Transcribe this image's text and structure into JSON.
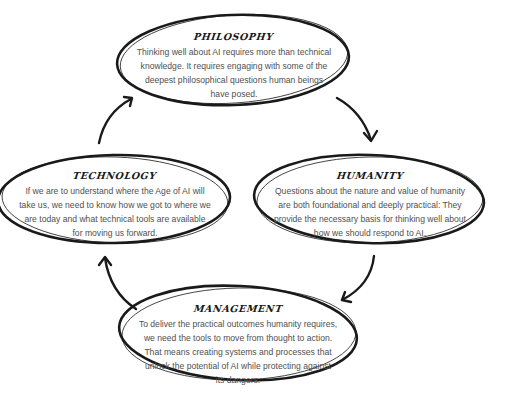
{
  "diagram": {
    "type": "cycle",
    "stroke_color": "#1a1a1a",
    "text_color": "#505050",
    "nodes": [
      {
        "id": "philosophy",
        "title": "Philosophy",
        "lines": [
          "Thinking well about AI requires more than technical",
          "knowledge. It requires engaging with some of the",
          "deepest philosophical questions human beings",
          "have posed."
        ]
      },
      {
        "id": "humanity",
        "title": "Humanity",
        "lines": [
          "Questions about the nature and value of humanity",
          "are both foundational and deeply practical: They",
          "provide the necessary basis for thinking well about",
          "how we should respond to AI."
        ]
      },
      {
        "id": "management",
        "title": "Management",
        "lines": [
          "To deliver the practical outcomes humanity requires,",
          "we need the tools to move from thought to action.",
          "That means creating systems and processes that",
          "unlock the potential of AI while protecting against",
          "its dangers."
        ]
      },
      {
        "id": "technology",
        "title": "Technology",
        "lines": [
          "If we are to understand where the Age of AI will",
          "take us, we need to know how we got to where we",
          "are today and what technical tools are available",
          "for moving us forward."
        ]
      }
    ],
    "edges": [
      {
        "from": "philosophy",
        "to": "humanity"
      },
      {
        "from": "humanity",
        "to": "management"
      },
      {
        "from": "management",
        "to": "technology"
      },
      {
        "from": "technology",
        "to": "philosophy"
      }
    ]
  }
}
